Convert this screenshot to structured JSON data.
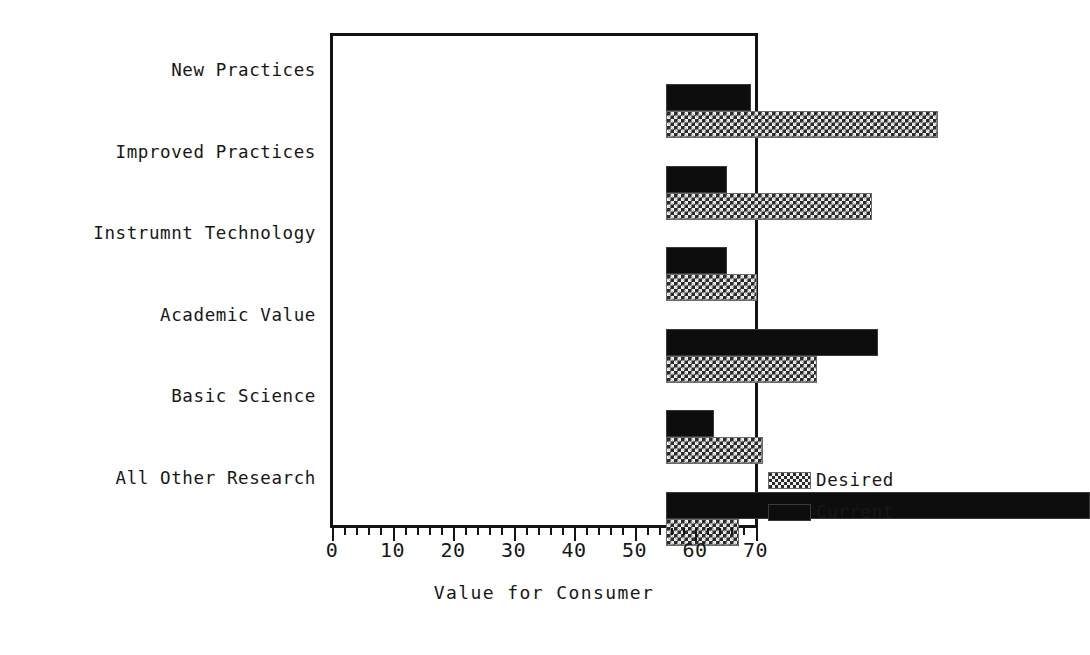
{
  "chart_data": {
    "type": "bar",
    "orientation": "horizontal",
    "title": "",
    "xlabel": "Value for Consumer",
    "ylabel": "",
    "xlim": [
      0,
      70
    ],
    "xticks": [
      0,
      10,
      20,
      30,
      40,
      50,
      60,
      70
    ],
    "xtick_labels": [
      "0",
      "10",
      "20",
      "30",
      "40",
      "50",
      "60",
      "70"
    ],
    "minor_tick_step": 2,
    "grid": false,
    "legend_position": "right-bottom",
    "categories": [
      "New Practices",
      "Improved Practices",
      "Instrumnt Technology",
      "Academic Value",
      "Basic Science",
      "All Other Research"
    ],
    "series": [
      {
        "name": "Current",
        "fill": "solid-black",
        "color": "#0d0d0d",
        "values": [
          14,
          10,
          10,
          35,
          8,
          70
        ]
      },
      {
        "name": "Desired",
        "fill": "checkerboard",
        "color": "#2b2b2b",
        "values": [
          45,
          34,
          15,
          25,
          16,
          12
        ]
      }
    ]
  },
  "axis": {
    "x_title": "Value for Consumer"
  },
  "legend": {
    "items": [
      {
        "label": "Desired",
        "swatch": "checkerboard-swatch"
      },
      {
        "label": "Current",
        "swatch": "solid-black-swatch"
      }
    ]
  }
}
